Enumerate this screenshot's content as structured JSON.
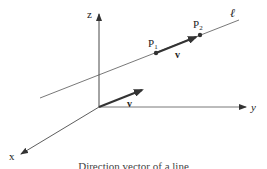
{
  "diagram": {
    "type": "3d-line-vector",
    "axes": {
      "x_label": "x",
      "y_label": "y",
      "z_label": "z"
    },
    "line_label": "ℓ",
    "points": [
      {
        "label": "P",
        "subscript": "1"
      },
      {
        "label": "P",
        "subscript": "2"
      }
    ],
    "vectors": [
      {
        "label": "v",
        "location": "on line from P1 toward P2"
      },
      {
        "label": "v",
        "location": "from origin"
      }
    ],
    "caption": "Direction vector of a line"
  }
}
